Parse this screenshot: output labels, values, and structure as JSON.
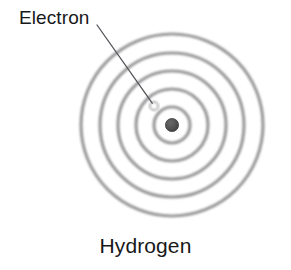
{
  "figure": {
    "title": "Hydrogen",
    "background_color": "#ffffff",
    "width": 291,
    "height": 270
  },
  "labels": {
    "electron": "Electron",
    "caption": "Hydrogen"
  },
  "colors": {
    "text": "#18181a",
    "orbit_ring": "#9a9a9a",
    "nucleus": "#4d4d4d",
    "nucleus_outline": "#3a3a3a",
    "electron_outline": "#8c8c8c",
    "leader_line": "#53535a",
    "background": "#ffffff"
  },
  "diagram": {
    "center": {
      "x": 172,
      "y": 125
    },
    "nucleus": {
      "name": "nucleus",
      "cx": 172,
      "cy": 125,
      "r": 6.5,
      "fill": "#4d4d4d"
    },
    "electron": {
      "name": "electron",
      "cx": 154,
      "cy": 106,
      "r": 4.0,
      "on_orbit": 1
    },
    "orbits": [
      {
        "n": 1,
        "r": 18
      },
      {
        "n": 2,
        "r": 36
      },
      {
        "n": 3,
        "r": 54
      },
      {
        "n": 4,
        "r": 72
      },
      {
        "n": 5,
        "r": 91
      }
    ],
    "orbit_count": 5,
    "ring_stroke_width": 3.2,
    "leader_line": {
      "name": "electron-leader-line",
      "x1": 97,
      "y1": 25,
      "x2": 152,
      "y2": 103,
      "stroke_width": 1.3
    }
  }
}
